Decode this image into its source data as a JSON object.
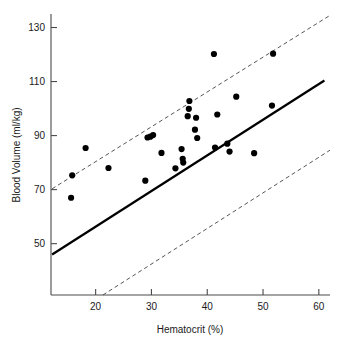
{
  "chart_data": {
    "type": "scatter",
    "title": "",
    "xlabel": "Hematocrit (%)",
    "ylabel": "Blood Volume (ml/kg)",
    "xlim": [
      12,
      62
    ],
    "ylim": [
      31,
      135
    ],
    "xticks": [
      20,
      30,
      40,
      50,
      60
    ],
    "yticks": [
      50,
      70,
      90,
      110,
      130
    ],
    "xtick_labels": [
      "20",
      "30",
      "40",
      "50",
      "60"
    ],
    "ytick_labels": [
      "50",
      "70",
      "90",
      "110",
      "130"
    ],
    "grid": false,
    "legend": false,
    "point_color": "#000000",
    "line_color": "#000000",
    "interval_color": "#555555",
    "points": [
      {
        "x": 15.6,
        "y": 67.0
      },
      {
        "x": 15.8,
        "y": 75.3
      },
      {
        "x": 18.2,
        "y": 85.4
      },
      {
        "x": 22.3,
        "y": 78.0
      },
      {
        "x": 28.9,
        "y": 73.3
      },
      {
        "x": 29.3,
        "y": 89.3
      },
      {
        "x": 29.8,
        "y": 89.6
      },
      {
        "x": 30.3,
        "y": 90.2
      },
      {
        "x": 31.8,
        "y": 83.6
      },
      {
        "x": 34.3,
        "y": 77.9
      },
      {
        "x": 35.4,
        "y": 85.0
      },
      {
        "x": 35.6,
        "y": 81.4
      },
      {
        "x": 35.7,
        "y": 80.0
      },
      {
        "x": 36.5,
        "y": 97.2
      },
      {
        "x": 36.7,
        "y": 99.9
      },
      {
        "x": 36.8,
        "y": 102.8
      },
      {
        "x": 37.8,
        "y": 92.2
      },
      {
        "x": 38.0,
        "y": 96.6
      },
      {
        "x": 38.2,
        "y": 89.1
      },
      {
        "x": 41.2,
        "y": 120.2
      },
      {
        "x": 41.4,
        "y": 85.6
      },
      {
        "x": 41.8,
        "y": 97.8
      },
      {
        "x": 43.6,
        "y": 87.0
      },
      {
        "x": 44.0,
        "y": 84.1
      },
      {
        "x": 45.2,
        "y": 104.4
      },
      {
        "x": 48.4,
        "y": 83.5
      },
      {
        "x": 51.6,
        "y": 101.1
      },
      {
        "x": 51.8,
        "y": 120.3
      }
    ],
    "fit_line": {
      "label": "regression line",
      "x_start": 12.2,
      "y_start": 46.0,
      "x_end": 61.0,
      "y_end": 110.4
    },
    "interval_lines": [
      {
        "label": "upper prediction limit",
        "x_start": 12.2,
        "y_start": 70.3,
        "x_end": 62.0,
        "y_end": 134.5
      },
      {
        "label": "lower prediction limit",
        "x_start": 21.3,
        "y_start": 31.0,
        "x_end": 62.0,
        "y_end": 84.6
      }
    ]
  }
}
